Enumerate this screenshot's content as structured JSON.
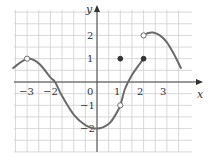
{
  "chart_data": {
    "type": "line",
    "title": "",
    "xlabel": "x",
    "ylabel": "y",
    "xlim": [
      -3.5,
      3.5
    ],
    "ylim": [
      -3,
      3
    ],
    "grid": true,
    "grid_step": 0.5,
    "x_ticks": [
      -3,
      -2,
      0,
      1,
      2,
      3
    ],
    "x_tick_labels": [
      "−3",
      "−2",
      "0",
      "1",
      "2",
      "3"
    ],
    "y_ticks": [
      2,
      1,
      -1,
      -2
    ],
    "y_tick_labels": [
      "2",
      "1",
      "−1",
      "−2"
    ],
    "series": [
      {
        "name": "piece-1",
        "description": "smooth curve from left edge through peak near (-3,1), down through (-1.8,0) to minimum near (0,-2), rising to hole at (1,-1) then continuing to filled point (2,1)",
        "points": [
          [
            -3.6,
            0.6
          ],
          [
            -3,
            1
          ],
          [
            -2.5,
            0.8
          ],
          [
            -2,
            0.2
          ],
          [
            -1.8,
            0
          ],
          [
            -1.5,
            -0.6
          ],
          [
            -1,
            -1.4
          ],
          [
            -0.5,
            -1.85
          ],
          [
            0,
            -2
          ],
          [
            0.5,
            -1.8
          ],
          [
            0.8,
            -1.4
          ],
          [
            1,
            -1
          ],
          [
            1.2,
            -0.3
          ],
          [
            1.5,
            0.3
          ],
          [
            2,
            1
          ]
        ]
      },
      {
        "name": "piece-2",
        "description": "curve starting at open circle (2,2), peaking near (2.4,2.1), descending to right edge",
        "points": [
          [
            2,
            2
          ],
          [
            2.2,
            2.1
          ],
          [
            2.4,
            2.12
          ],
          [
            2.7,
            2.0
          ],
          [
            3,
            1.7
          ],
          [
            3.3,
            1.2
          ],
          [
            3.6,
            0.6
          ]
        ]
      }
    ],
    "markers": [
      {
        "x": -3,
        "y": 1,
        "style": "open"
      },
      {
        "x": 1,
        "y": -1,
        "style": "open"
      },
      {
        "x": 1,
        "y": 1,
        "style": "filled"
      },
      {
        "x": 2,
        "y": 1,
        "style": "filled"
      },
      {
        "x": 2,
        "y": 2,
        "style": "open"
      }
    ]
  },
  "labels": {
    "x_axis": "x",
    "y_axis": "y",
    "origin": "0",
    "xm3": "−3",
    "xm2": "−2",
    "x1": "1",
    "x2": "2",
    "x3": "3",
    "y2": "2",
    "y1": "1",
    "ym1": "−1",
    "ym2": "−2"
  },
  "colors": {
    "curve": "#6b6b6b",
    "grid": "#cfcfcf",
    "axis": "#444444"
  }
}
